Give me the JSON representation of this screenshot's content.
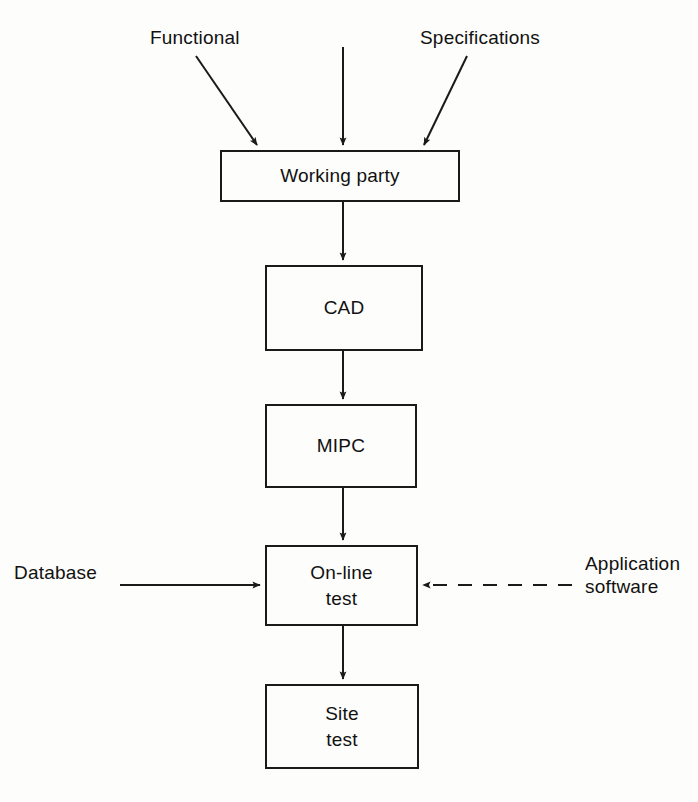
{
  "diagram": {
    "background_color": "#fdfdfb",
    "line_color": "#1a1a1a",
    "nodes": [
      {
        "id": "working-party",
        "label": "Working party"
      },
      {
        "id": "cad",
        "label": "CAD"
      },
      {
        "id": "mipc",
        "label": "MIPC"
      },
      {
        "id": "online-test",
        "label": "On-line\ntest"
      },
      {
        "id": "site-test",
        "label": "Site\ntest"
      }
    ],
    "edge_labels": [
      {
        "id": "functional",
        "label": "Functional"
      },
      {
        "id": "specifications",
        "label": "Specifications"
      },
      {
        "id": "database",
        "label": "Database"
      },
      {
        "id": "application-software",
        "label": "Application\nsoftware"
      }
    ],
    "connections": [
      {
        "from": "functional",
        "to": "working-party",
        "style": "solid",
        "direction": "diagonal-down-right"
      },
      {
        "from": "unlabeled-top-center",
        "to": "working-party",
        "style": "solid",
        "direction": "down"
      },
      {
        "from": "specifications",
        "to": "working-party",
        "style": "solid",
        "direction": "diagonal-down-left"
      },
      {
        "from": "working-party",
        "to": "cad",
        "style": "solid",
        "direction": "down"
      },
      {
        "from": "cad",
        "to": "mipc",
        "style": "solid",
        "direction": "down"
      },
      {
        "from": "mipc",
        "to": "online-test",
        "style": "solid",
        "direction": "down"
      },
      {
        "from": "database",
        "to": "online-test",
        "style": "solid",
        "direction": "right"
      },
      {
        "from": "application-software",
        "to": "online-test",
        "style": "dashed",
        "direction": "left"
      },
      {
        "from": "online-test",
        "to": "site-test",
        "style": "solid",
        "direction": "down"
      }
    ]
  }
}
